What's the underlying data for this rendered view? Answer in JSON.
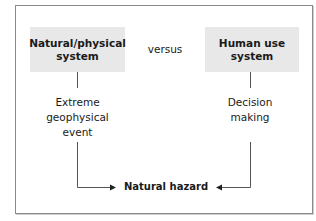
{
  "diagram": {
    "left_system": "Natural/physical system",
    "left_system_lines": [
      "Natural/physical",
      "system"
    ],
    "right_system_lines": [
      "Human use",
      "system"
    ],
    "connector_word": "versus",
    "left_process_lines": [
      "Extreme",
      "geophysical",
      "event"
    ],
    "right_process_lines": [
      "Decision",
      "making"
    ],
    "outcome": "Natural hazard"
  },
  "colors": {
    "box_fill": "#e8e8e8",
    "line": "#555555",
    "frame": "#8a8a8a"
  }
}
